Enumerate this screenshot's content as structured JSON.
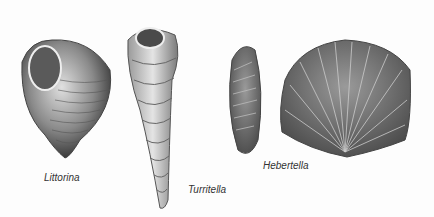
{
  "illustration": {
    "specimens": [
      {
        "name": "Littorina",
        "type": "gastropod"
      },
      {
        "name": "Turritella",
        "type": "gastropod"
      },
      {
        "name": "Hebertella",
        "type": "brachiopod"
      }
    ],
    "colors": {
      "background": "#fdfdfd",
      "shell_dark": "#3a3a3a",
      "shell_mid": "#8a8a8a",
      "shell_light": "#d8d8d8",
      "label": "#333333"
    }
  }
}
